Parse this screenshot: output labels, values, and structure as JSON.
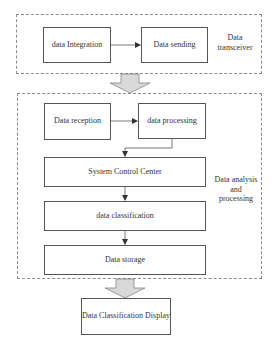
{
  "groups": {
    "transceiver": {
      "label": "Data transceiver"
    },
    "analysis": {
      "label": "Data analysis and processing"
    }
  },
  "nodes": {
    "data_integration": "data Integration",
    "data_sending": "Data sending",
    "data_reception": "Data reception",
    "data_processing": "data processing",
    "system_control_center": "System Control Center",
    "data_classification": "data classification",
    "data_storage": "Data storage",
    "data_classification_display": "Data Classification Display"
  },
  "colors": {
    "line": "#555555",
    "dashed_border": "#8a8a8a",
    "block_arrow_fill": "#d9d9d9"
  }
}
